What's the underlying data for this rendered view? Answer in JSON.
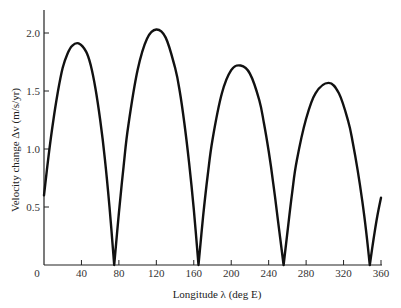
{
  "chart_data": {
    "type": "line",
    "title": "",
    "xlabel": "Longitude λ (deg E)",
    "ylabel": "Velocity change Δv (m/s/yr)",
    "xlim": [
      0,
      360
    ],
    "ylim": [
      0,
      2.2
    ],
    "grid": false,
    "legend": null,
    "x_ticks": [
      0,
      40,
      80,
      120,
      160,
      200,
      240,
      280,
      320,
      360
    ],
    "x_tick_labels": [
      "0",
      "40",
      "80",
      "120",
      "160",
      "200",
      "240",
      "280",
      "320",
      "360"
    ],
    "y_ticks": [
      0,
      0.5,
      1.0,
      1.5,
      2.0
    ],
    "y_tick_labels": [
      "0",
      "0.5",
      "1.0",
      "1.5",
      "2.0"
    ],
    "series": [
      {
        "name": "Δv",
        "description": "Four arch-shaped lobes touching zero at ~75°, ~165°, ~256°, ~348° E",
        "x": [
          0,
          5,
          10,
          15,
          20,
          25,
          30,
          37,
          45,
          50,
          55,
          60,
          65,
          70,
          75,
          80,
          85,
          90,
          100,
          110,
          120,
          130,
          140,
          145,
          150,
          155,
          160,
          165,
          170,
          175,
          180,
          190,
          200,
          210,
          220,
          230,
          235,
          240,
          245,
          250,
          256,
          260,
          265,
          270,
          280,
          290,
          304,
          315,
          325,
          330,
          335,
          340,
          344,
          348,
          352,
          356,
          360
        ],
        "y": [
          0.6,
          0.95,
          1.25,
          1.5,
          1.7,
          1.82,
          1.89,
          1.91,
          1.84,
          1.72,
          1.52,
          1.25,
          0.92,
          0.5,
          0.0,
          0.45,
          0.85,
          1.2,
          1.68,
          1.95,
          2.03,
          1.96,
          1.7,
          1.5,
          1.22,
          0.88,
          0.48,
          0.0,
          0.42,
          0.78,
          1.08,
          1.48,
          1.68,
          1.72,
          1.65,
          1.42,
          1.22,
          0.98,
          0.7,
          0.38,
          0.0,
          0.28,
          0.62,
          0.9,
          1.26,
          1.48,
          1.57,
          1.48,
          1.24,
          1.05,
          0.82,
          0.55,
          0.3,
          0.0,
          0.22,
          0.42,
          0.58
        ]
      }
    ]
  }
}
